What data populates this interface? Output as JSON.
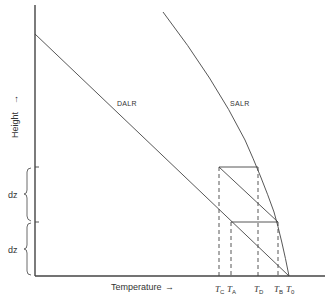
{
  "diagram": {
    "type": "lapse-rate-diagram",
    "axes": {
      "x_label": "Temperature",
      "x_arrow": "→",
      "y_label": "Height",
      "y_arrow": "→"
    },
    "curves": [
      {
        "id": "dalr",
        "label": "DALR"
      },
      {
        "id": "salr",
        "label": "SALR"
      }
    ],
    "height_intervals": [
      {
        "label": "dz"
      },
      {
        "label": "dz"
      }
    ],
    "temperature_markers": [
      {
        "symbol": "T",
        "sub": "C"
      },
      {
        "symbol": "T",
        "sub": "A"
      },
      {
        "symbol": "T",
        "sub": "D"
      },
      {
        "symbol": "T",
        "sub": "B"
      },
      {
        "symbol": "T",
        "sub": "0"
      }
    ],
    "colors": {
      "line": "#333333",
      "background": "#ffffff"
    }
  }
}
